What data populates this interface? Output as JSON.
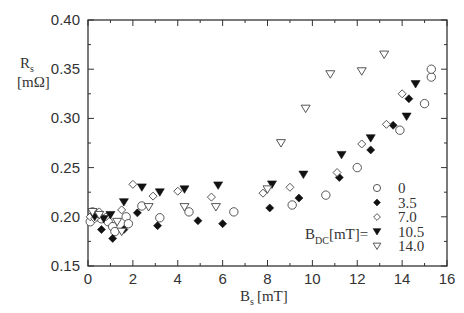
{
  "chart_data": {
    "type": "scatter",
    "title": "",
    "xlabel": "B_s [mT]",
    "ylabel": "R_s [mΩ]",
    "xlim": [
      0,
      16
    ],
    "ylim": [
      0.15,
      0.4
    ],
    "xticks": [
      0,
      2,
      4,
      6,
      8,
      10,
      12,
      14,
      16
    ],
    "yticks": [
      0.15,
      0.2,
      0.25,
      0.3,
      0.35,
      0.4
    ],
    "xtick_labels": [
      "0",
      "2",
      "4",
      "6",
      "8",
      "10",
      "12",
      "14",
      "16"
    ],
    "ytick_labels": [
      "0.15",
      "0.20",
      "0.25",
      "0.30",
      "0.35",
      "0.40"
    ],
    "grid": false,
    "legend_title": "B_DC[mT]=",
    "legend_position": "lower right",
    "series": [
      {
        "name": "0",
        "marker": "open-circle",
        "points": [
          [
            0.1,
            0.195
          ],
          [
            0.2,
            0.205
          ],
          [
            0.4,
            0.2
          ],
          [
            0.6,
            0.198
          ],
          [
            0.9,
            0.195
          ],
          [
            1.1,
            0.19
          ],
          [
            1.2,
            0.185
          ],
          [
            1.7,
            0.2
          ],
          [
            1.8,
            0.193
          ],
          [
            2.4,
            0.211
          ],
          [
            3.2,
            0.199
          ],
          [
            4.5,
            0.205
          ],
          [
            6.5,
            0.205
          ],
          [
            9.1,
            0.212
          ],
          [
            10.6,
            0.222
          ],
          [
            12.0,
            0.25
          ],
          [
            13.9,
            0.288
          ],
          [
            15.0,
            0.315
          ],
          [
            15.3,
            0.342
          ],
          [
            15.3,
            0.35
          ]
        ]
      },
      {
        "name": "3.5",
        "marker": "filled-diamond",
        "points": [
          [
            0.6,
            0.187
          ],
          [
            1.1,
            0.178
          ],
          [
            1.6,
            0.187
          ],
          [
            2.2,
            0.204
          ],
          [
            3.1,
            0.191
          ],
          [
            4.9,
            0.196
          ],
          [
            6.0,
            0.193
          ],
          [
            8.1,
            0.209
          ],
          [
            9.4,
            0.219
          ],
          [
            11.2,
            0.24
          ],
          [
            12.6,
            0.268
          ],
          [
            13.6,
            0.293
          ],
          [
            14.3,
            0.32
          ]
        ]
      },
      {
        "name": "7.0",
        "marker": "open-diamond",
        "points": [
          [
            0.1,
            0.2
          ],
          [
            0.3,
            0.198
          ],
          [
            0.5,
            0.205
          ],
          [
            0.8,
            0.2
          ],
          [
            1.5,
            0.207
          ],
          [
            2.0,
            0.233
          ],
          [
            2.9,
            0.221
          ],
          [
            4.0,
            0.226
          ],
          [
            5.5,
            0.22
          ],
          [
            7.8,
            0.224
          ],
          [
            9.0,
            0.23
          ],
          [
            11.1,
            0.245
          ],
          [
            12.2,
            0.274
          ],
          [
            13.3,
            0.294
          ],
          [
            14.0,
            0.325
          ]
        ]
      },
      {
        "name": "10.5",
        "marker": "filled-triangle-down",
        "points": [
          [
            0.3,
            0.2
          ],
          [
            0.7,
            0.198
          ],
          [
            1.0,
            0.202
          ],
          [
            1.6,
            0.215
          ],
          [
            2.4,
            0.23
          ],
          [
            3.2,
            0.225
          ],
          [
            4.3,
            0.228
          ],
          [
            5.8,
            0.232
          ],
          [
            8.2,
            0.233
          ],
          [
            9.6,
            0.243
          ],
          [
            11.3,
            0.263
          ],
          [
            12.6,
            0.28
          ],
          [
            14.2,
            0.302
          ],
          [
            14.6,
            0.335
          ]
        ]
      },
      {
        "name": "14.0",
        "marker": "open-triangle-down",
        "points": [
          [
            0.2,
            0.205
          ],
          [
            0.5,
            0.202
          ],
          [
            1.3,
            0.195
          ],
          [
            1.5,
            0.185
          ],
          [
            2.7,
            0.21
          ],
          [
            4.3,
            0.21
          ],
          [
            5.7,
            0.21
          ],
          [
            8.0,
            0.228
          ],
          [
            8.6,
            0.275
          ],
          [
            9.7,
            0.31
          ],
          [
            10.8,
            0.345
          ],
          [
            12.2,
            0.348
          ],
          [
            13.2,
            0.365
          ]
        ]
      }
    ]
  },
  "labels": {
    "ylabel_main": "R",
    "ylabel_sub": "s",
    "ylabel_unit": "[mΩ]",
    "xlabel_main": "B",
    "xlabel_sub": "s",
    "xlabel_unit": "[mT]",
    "legend_main": "B",
    "legend_sub": "DC",
    "legend_rest": "[mT]="
  }
}
